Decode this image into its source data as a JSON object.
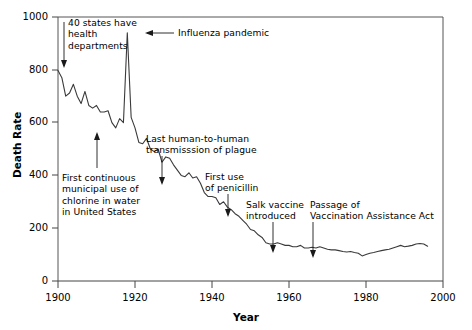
{
  "chart_data": {
    "type": "line",
    "title": "",
    "xlabel": "Year",
    "ylabel": "Death Rate",
    "xlim": [
      1900,
      2000
    ],
    "ylim": [
      0,
      1000
    ],
    "xticks": [
      1900,
      1920,
      1940,
      1960,
      1980,
      2000
    ],
    "xticklabels": [
      "1900",
      "1920",
      "1940",
      "1960",
      "1980",
      "2000"
    ],
    "yticks": [
      0,
      200,
      400,
      600,
      800,
      1000
    ],
    "yticklabels": [
      "0",
      "200",
      "400",
      "600",
      "800",
      "1000"
    ],
    "grid": false,
    "legend": null,
    "line_color": "#3a3a3a",
    "series": [
      {
        "name": "Crude death rate for infectious diseases",
        "x": [
          1900,
          1901,
          1902,
          1903,
          1904,
          1905,
          1906,
          1907,
          1908,
          1909,
          1910,
          1911,
          1912,
          1913,
          1914,
          1915,
          1916,
          1917,
          1918,
          1919,
          1920,
          1921,
          1922,
          1923,
          1924,
          1925,
          1926,
          1927,
          1928,
          1929,
          1930,
          1931,
          1932,
          1933,
          1934,
          1935,
          1936,
          1937,
          1938,
          1939,
          1940,
          1941,
          1942,
          1943,
          1944,
          1945,
          1946,
          1947,
          1948,
          1949,
          1950,
          1951,
          1952,
          1953,
          1954,
          1955,
          1956,
          1957,
          1958,
          1959,
          1960,
          1961,
          1962,
          1963,
          1964,
          1965,
          1966,
          1967,
          1968,
          1969,
          1970,
          1971,
          1972,
          1973,
          1974,
          1975,
          1976,
          1977,
          1978,
          1979,
          1980,
          1981,
          1982,
          1983,
          1984,
          1985,
          1986,
          1987,
          1988,
          1989,
          1990,
          1991,
          1992,
          1993,
          1994,
          1995,
          1996
        ],
        "values": [
          797,
          770,
          700,
          712,
          745,
          700,
          672,
          718,
          665,
          655,
          665,
          640,
          640,
          645,
          600,
          580,
          615,
          600,
          940,
          620,
          580,
          525,
          520,
          540,
          500,
          490,
          500,
          450,
          470,
          465,
          440,
          420,
          400,
          395,
          410,
          390,
          395,
          370,
          335,
          320,
          320,
          315,
          290,
          300,
          280,
          270,
          255,
          245,
          230,
          215,
          195,
          190,
          175,
          165,
          145,
          140,
          140,
          145,
          140,
          135,
          135,
          130,
          130,
          135,
          125,
          125,
          128,
          125,
          130,
          125,
          120,
          118,
          118,
          115,
          112,
          110,
          112,
          108,
          105,
          95,
          100,
          105,
          108,
          112,
          115,
          118,
          120,
          125,
          130,
          135,
          130,
          132,
          135,
          140,
          142,
          140,
          132
        ]
      }
    ],
    "annotations": [
      {
        "id": "states-health-departments",
        "lines": [
          "40 states have",
          "health",
          "departments"
        ],
        "text": "40 states have health departments",
        "target_year": 1900,
        "target_value": 800
      },
      {
        "id": "influenza-pandemic",
        "lines": [
          "Influenza pandemic"
        ],
        "text": "Influenza pandemic",
        "target_year": 1918,
        "target_value": 940
      },
      {
        "id": "chlorine-water",
        "lines": [
          "First continuous",
          "municipal use of",
          "chlorine in water",
          "in United States"
        ],
        "text": "First continuous municipal use of chlorine in water in United States",
        "target_year": 1908,
        "target_value": 640
      },
      {
        "id": "plague-transmission",
        "lines": [
          "Last human-to-human",
          "transmisssion of plague"
        ],
        "text": "Last human-to-human transmisssion of plague",
        "target_year": 1925,
        "target_value": 490
      },
      {
        "id": "first-penicillin",
        "lines": [
          "First use",
          "of penicillin"
        ],
        "text": "First use of penicillin",
        "target_year": 1943,
        "target_value": 300
      },
      {
        "id": "salk-vaccine",
        "lines": [
          "Salk vaccine",
          "introduced"
        ],
        "text": "Salk vaccine introduced",
        "target_year": 1955,
        "target_value": 140
      },
      {
        "id": "vaccination-assistance-act",
        "lines": [
          "Passage of",
          "Vaccination Assistance Act"
        ],
        "text": "Passage of Vaccination Assistance Act",
        "target_year": 1963,
        "target_value": 135
      }
    ]
  },
  "axes": {
    "ylabel": "Death Rate",
    "xlabel": "Year",
    "yticklabels": [
      "1000",
      "800",
      "600",
      "400",
      "200",
      "0"
    ],
    "xticklabels": [
      "1900",
      "1920",
      "1940",
      "1960",
      "1980",
      "2000"
    ]
  },
  "annotations_text": {
    "states_line1": "40 states have",
    "states_line2": "health",
    "states_line3": "departments",
    "influenza": "Influenza pandemic",
    "chlorine_line1": "First continuous",
    "chlorine_line2": "municipal use of",
    "chlorine_line3": "chlorine in water",
    "chlorine_line4": "in United States",
    "plague_line1": "Last human-to-human",
    "plague_line2": "transmisssion of plague",
    "penicillin_line1": "First use",
    "penicillin_line2": "of penicillin",
    "salk_line1": "Salk vaccine",
    "salk_line2": "introduced",
    "vaccination_line1": "Passage of",
    "vaccination_line2": "Vaccination Assistance Act"
  }
}
